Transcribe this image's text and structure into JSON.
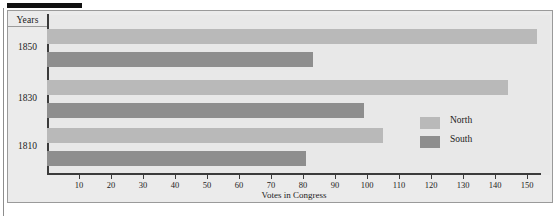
{
  "chart_data": {
    "type": "bar",
    "orientation": "horizontal",
    "title": "",
    "xlabel": "Votes in Congress",
    "ylabel": "Years",
    "categories": [
      "1850",
      "1830",
      "1810"
    ],
    "series": [
      {
        "name": "North",
        "color": "#b9b9b9",
        "values": [
          153,
          144,
          105
        ]
      },
      {
        "name": "South",
        "color": "#8e8e8e",
        "values": [
          83,
          99,
          81
        ]
      }
    ],
    "xlim": [
      0,
      155
    ],
    "xticks": [
      10,
      20,
      30,
      40,
      50,
      60,
      70,
      80,
      90,
      100,
      110,
      120,
      130,
      140,
      150
    ],
    "grid": false,
    "legend_position": "right-inside"
  },
  "axis": {
    "y_header": "Years",
    "x_title": "Votes in Congress",
    "tick_labels": [
      "10",
      "20",
      "30",
      "40",
      "50",
      "60",
      "70",
      "80",
      "90",
      "100",
      "110",
      "120",
      "130",
      "140",
      "150"
    ],
    "year_labels": [
      "1850",
      "1830",
      "1810"
    ]
  },
  "legend": {
    "entries": [
      {
        "label": "North",
        "swatch": "north-swatch"
      },
      {
        "label": "South",
        "swatch": "south-swatch"
      }
    ]
  },
  "decor": {
    "top_rule": "",
    "caption_clipped": ""
  }
}
